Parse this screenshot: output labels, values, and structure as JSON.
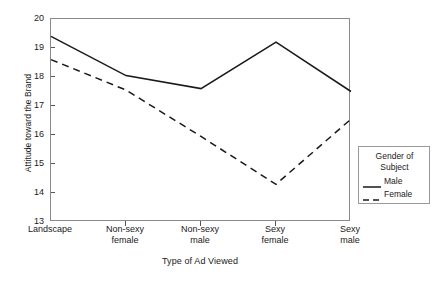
{
  "chart_data": {
    "type": "line",
    "title": "",
    "xlabel": "Type of Ad Viewed",
    "ylabel": "Attitude toward the Brand",
    "categories": [
      "Landscape",
      "Non-sexy female",
      "Non-sexy male",
      "Sexy female",
      "Sexy male"
    ],
    "category_lines": [
      [
        "Landscape"
      ],
      [
        "Non-sexy",
        "female"
      ],
      [
        "Non-sexy",
        "male"
      ],
      [
        "Sexy",
        "female"
      ],
      [
        "Sexy",
        "male"
      ]
    ],
    "ylim": [
      13,
      20
    ],
    "yticks": [
      13,
      14,
      15,
      16,
      17,
      18,
      19,
      20
    ],
    "grid": false,
    "legend_position": "right",
    "legend_title_lines": [
      "Gender of",
      "Subject"
    ],
    "series": [
      {
        "name": "Male",
        "style": "solid",
        "color": "#1a1a1a",
        "values": [
          19.4,
          18.05,
          17.6,
          19.2,
          17.5
        ]
      },
      {
        "name": "Female",
        "style": "dashed",
        "color": "#1a1a1a",
        "values": [
          18.6,
          17.55,
          15.95,
          14.3,
          16.55
        ]
      }
    ]
  },
  "legend": {
    "title_line1": "Gender of",
    "title_line2": "Subject",
    "items": [
      {
        "label": "Male"
      },
      {
        "label": "Female"
      }
    ]
  }
}
